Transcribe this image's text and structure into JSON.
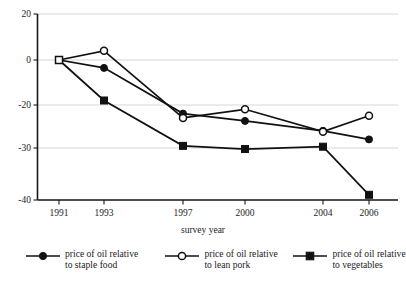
{
  "chart_data": {
    "type": "line",
    "title": "",
    "xlabel": "survey year",
    "ylabel": "",
    "categories": [
      "1991",
      "1993",
      "1997",
      "2000",
      "2004",
      "2006"
    ],
    "x_tick_labels": [
      "1991",
      "1993",
      "1997",
      "2000",
      "2004",
      "2006"
    ],
    "y_tick_labels": [
      "20",
      "0",
      "-20",
      "-30",
      "-40"
    ],
    "y_tick_values": [
      20,
      0,
      -20,
      -30,
      -40
    ],
    "ylim": [
      -40,
      20
    ],
    "grid": true,
    "legend_position": "bottom",
    "series": [
      {
        "name": "price of oil relative\nto staple food",
        "marker": "filled-circle",
        "values": [
          0,
          -3.5,
          -22,
          -23.7,
          -26,
          -28
        ]
      },
      {
        "name": "price of oil relative\nto lean pork",
        "marker": "open-circle",
        "values": [
          0,
          4,
          -23,
          -21,
          -26.2,
          -22.5
        ]
      },
      {
        "name": "price of oil relative\nto vegetables",
        "marker": "filled-square",
        "values": [
          0,
          -18,
          -29.5,
          -30.2,
          -29.7,
          -39
        ]
      }
    ],
    "origin_marker": "open-square"
  },
  "legend": {
    "entries": [
      {
        "marker": "filled-circle",
        "label": "price of oil relative\nto staple food"
      },
      {
        "marker": "open-circle",
        "label": "price of oil relative\nto lean pork"
      },
      {
        "marker": "filled-square",
        "label": "price of oil relative\nto vegetables"
      }
    ]
  }
}
